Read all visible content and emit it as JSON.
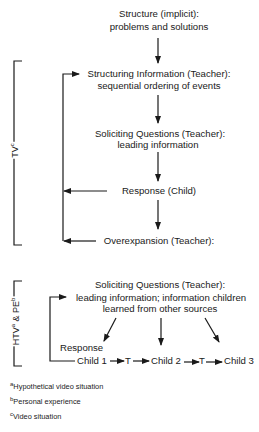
{
  "colors": {
    "ink": "#1a1a1a",
    "background": "#ffffff"
  },
  "top_section": {
    "structure": {
      "line1": "Structure (implicit):",
      "line2": "problems and solutions"
    },
    "structuring": {
      "line1": "Structuring Information (Teacher):",
      "line2": "sequential ordering of events"
    },
    "soliciting": {
      "line1": "Soliciting Questions (Teacher):",
      "line2": "leading information"
    },
    "response": "Response (Child)",
    "overexpansion": "Overexpansion (Teacher):",
    "bracket_label": {
      "text": "TV",
      "sup": "c"
    }
  },
  "bottom_section": {
    "soliciting": {
      "line1": "Soliciting Questions (Teacher):",
      "line2": "leading information; information children",
      "line3": "learned from other sources"
    },
    "response_label": "Response",
    "sequence": [
      "Child 1",
      "T",
      "Child 2",
      "T",
      "Child 3"
    ],
    "bracket_label": {
      "part1": "HTV",
      "sup1": "a",
      "part2": " & PE",
      "sup2": "b"
    }
  },
  "footnotes": [
    {
      "mark": "a",
      "text": "Hypothetical video situation"
    },
    {
      "mark": "b",
      "text": "Personal experience"
    },
    {
      "mark": "c",
      "text": "Video situation"
    }
  ]
}
